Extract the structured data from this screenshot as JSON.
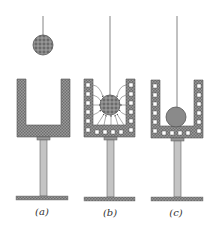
{
  "figure": {
    "panels": [
      {
        "id": "a",
        "label": "(a)",
        "state": "charged ball above uncharged cup",
        "ball_charge": "negative",
        "cup_induced_charges": false,
        "field_lines": false
      },
      {
        "id": "b",
        "label": "(b)",
        "state": "ball lowered inside cup, charges induced, field lines from cup walls to ball",
        "ball_charge": "negative",
        "cup_induced_charges": true,
        "field_lines": true
      },
      {
        "id": "c",
        "label": "(c)",
        "state": "ball touches inside bottom of cup, charge transferred to outer surface",
        "ball_charge": "neutral",
        "cup_induced_charges": true,
        "field_lines": false
      }
    ]
  },
  "colors": {
    "metal_fill": "#8f8f8f",
    "stand": "#b8b8b8",
    "base": "#8a8a8a",
    "line": "#555555",
    "ball_charged": "#7d7d7d",
    "ball_neutral": "#8a8a8a"
  }
}
